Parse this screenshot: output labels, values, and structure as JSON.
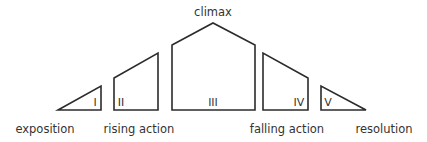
{
  "diagram": {
    "title_label": "climax",
    "stages": [
      {
        "numeral": "I",
        "caption": "exposition"
      },
      {
        "numeral": "II",
        "caption": "rising action"
      },
      {
        "numeral": "III",
        "caption": ""
      },
      {
        "numeral": "IV",
        "caption": "falling action"
      },
      {
        "numeral": "V",
        "caption": "resolution"
      }
    ],
    "stroke_color": "#2b2b2b",
    "text_color": "#333333"
  }
}
